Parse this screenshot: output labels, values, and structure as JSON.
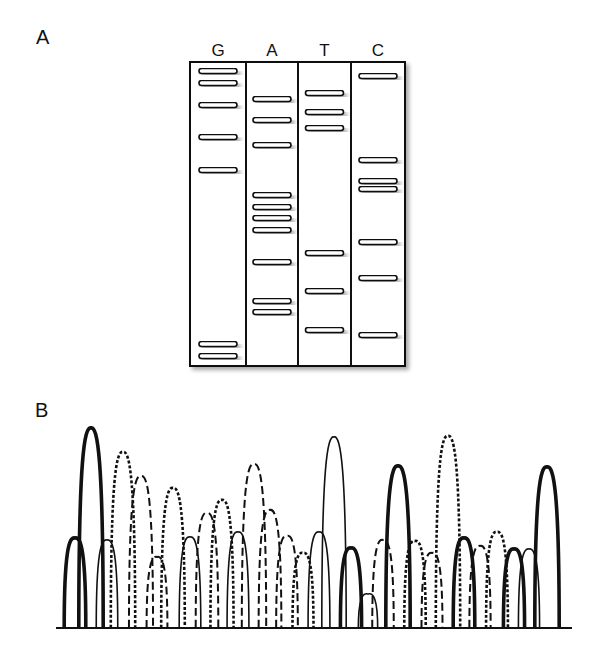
{
  "panels": {
    "a": {
      "label": "A"
    },
    "b": {
      "label": "B"
    }
  },
  "gel": {
    "lanes": [
      {
        "base": "G",
        "band_y": [
          71,
          83,
          105,
          137,
          170,
          344,
          356
        ]
      },
      {
        "base": "A",
        "band_y": [
          99,
          120,
          145,
          195,
          207,
          218,
          230,
          262,
          301,
          312
        ]
      },
      {
        "base": "T",
        "band_y": [
          93,
          112,
          128,
          253,
          291,
          330
        ]
      },
      {
        "base": "C",
        "band_y": [
          76,
          160,
          181,
          189,
          242,
          278,
          335
        ]
      }
    ],
    "box": {
      "x": 190,
      "y": 62,
      "width": 215,
      "height": 304
    },
    "dividers_x": [
      246,
      298,
      351
    ]
  },
  "chromatogram": {
    "baseline_y": 628,
    "baseline_x": [
      56,
      572
    ],
    "legend_styles": {
      "G": "thick-solid",
      "T": "thin-solid",
      "C": "dotted",
      "A": "long-dashed"
    },
    "peaks": [
      {
        "base": "G",
        "x": 75,
        "top": 538
      },
      {
        "base": "G",
        "x": 91,
        "top": 428
      },
      {
        "base": "T",
        "x": 107,
        "top": 540
      },
      {
        "base": "C",
        "x": 123,
        "top": 452
      },
      {
        "base": "A",
        "x": 141,
        "top": 476
      },
      {
        "base": "A",
        "x": 157,
        "top": 557
      },
      {
        "base": "C",
        "x": 173,
        "top": 488
      },
      {
        "base": "T",
        "x": 190,
        "top": 537
      },
      {
        "base": "A",
        "x": 207,
        "top": 513
      },
      {
        "base": "C",
        "x": 222,
        "top": 500
      },
      {
        "base": "T",
        "x": 238,
        "top": 532
      },
      {
        "base": "A",
        "x": 254,
        "top": 464
      },
      {
        "base": "A",
        "x": 270,
        "top": 510
      },
      {
        "base": "A",
        "x": 287,
        "top": 536
      },
      {
        "base": "C",
        "x": 303,
        "top": 553
      },
      {
        "base": "T",
        "x": 319,
        "top": 532
      },
      {
        "base": "T",
        "x": 334,
        "top": 437
      },
      {
        "base": "G",
        "x": 351,
        "top": 548
      },
      {
        "base": "T",
        "x": 368,
        "top": 594
      },
      {
        "base": "A",
        "x": 383,
        "top": 540
      },
      {
        "base": "G",
        "x": 398,
        "top": 466
      },
      {
        "base": "C",
        "x": 415,
        "top": 541
      },
      {
        "base": "A",
        "x": 432,
        "top": 553
      },
      {
        "base": "C",
        "x": 448,
        "top": 436
      },
      {
        "base": "G",
        "x": 464,
        "top": 538
      },
      {
        "base": "A",
        "x": 480,
        "top": 546
      },
      {
        "base": "C",
        "x": 497,
        "top": 532
      },
      {
        "base": "G",
        "x": 514,
        "top": 549
      },
      {
        "base": "T",
        "x": 529,
        "top": 549
      },
      {
        "base": "G",
        "x": 547,
        "top": 467
      }
    ]
  }
}
